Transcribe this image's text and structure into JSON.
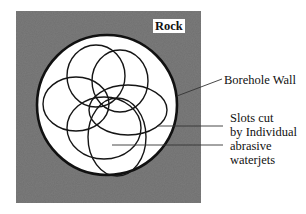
{
  "diagram": {
    "labels": {
      "rock": "Rock",
      "borehole_wall": "Borehole Wall",
      "slots": [
        "Slots cut",
        "by Individual",
        "abrasive",
        "waterjets"
      ]
    },
    "colors": {
      "rock_fill": "#6e6e6e",
      "borehole_fill": "#ffffff",
      "stroke": "#111111",
      "leader": "#333333"
    },
    "borehole": {
      "cx": 107,
      "cy": 105,
      "r": 70
    },
    "slot_count": 6
  }
}
